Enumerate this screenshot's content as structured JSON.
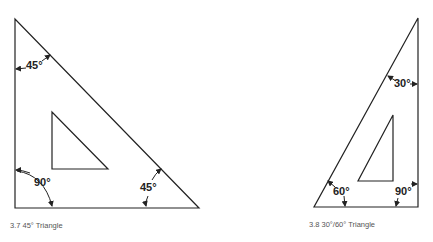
{
  "figures": [
    {
      "caption": "3.7  45° Triangle",
      "angles": {
        "top": "45°",
        "right_angle": "90°",
        "bottom": "45°"
      }
    },
    {
      "caption": "3.8  30°/60° Triangle",
      "angles": {
        "top": "30°",
        "bottom_left": "60°",
        "right_angle": "90°"
      }
    }
  ],
  "colors": {
    "line": "#222222",
    "caption": "#555555",
    "background": "#ffffff"
  }
}
